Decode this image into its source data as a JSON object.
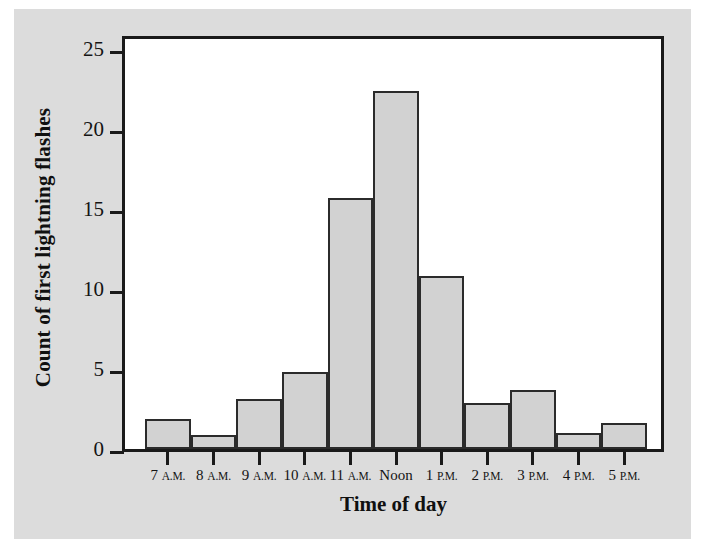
{
  "chart_data": {
    "type": "bar",
    "title": "",
    "subtitle": "",
    "xlabel": "Time of day",
    "ylabel": "Count of first lightning flashes",
    "categories": [
      "7 A.M.",
      "8 A.M.",
      "9 A.M.",
      "10 A.M.",
      "11 A.M.",
      "Noon",
      "1 P.M.",
      "2 P.M.",
      "3 P.M.",
      "4 P.M.",
      "5 P.M."
    ],
    "category_parts": [
      {
        "num": "7",
        "suffix": "A.M."
      },
      {
        "num": "8",
        "suffix": "A.M."
      },
      {
        "num": "9",
        "suffix": "A.M."
      },
      {
        "num": "10",
        "suffix": "A.M."
      },
      {
        "num": "11",
        "suffix": "A.M."
      },
      {
        "num": "Noon",
        "suffix": ""
      },
      {
        "num": "1",
        "suffix": "P.M."
      },
      {
        "num": "2",
        "suffix": "P.M."
      },
      {
        "num": "3",
        "suffix": "P.M."
      },
      {
        "num": "4",
        "suffix": "P.M."
      },
      {
        "num": "5",
        "suffix": "P.M."
      }
    ],
    "values": [
      1.9,
      0.9,
      3.1,
      4.8,
      15.7,
      22.4,
      10.8,
      2.9,
      3.7,
      1.0,
      1.6
    ],
    "ylim": [
      0,
      26
    ],
    "xlim": [
      0,
      11
    ],
    "yticks": [
      0,
      5,
      10,
      15,
      20,
      25
    ],
    "ytick_labels": [
      "0",
      "5",
      "10",
      "15",
      "20",
      "25"
    ],
    "grid": false,
    "legend": false,
    "legend_position": "none",
    "bar_fill": "#d2d2d2",
    "bar_edge": "#2b2b2b",
    "axis_color": "#1a1a1a",
    "plot_background": "#ffffff",
    "page_background": "#dcdcdc"
  }
}
